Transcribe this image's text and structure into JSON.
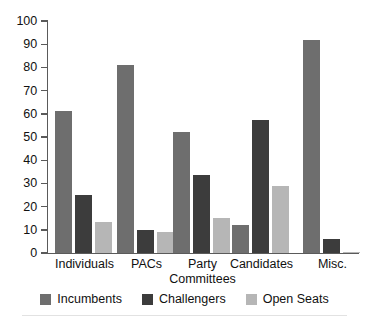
{
  "chart_data": {
    "type": "bar",
    "title": "",
    "subtitle": "",
    "xlabel": "",
    "ylabel": "",
    "ylim": [
      0,
      100
    ],
    "ytick_step": 10,
    "yticks": [
      100,
      90,
      80,
      70,
      60,
      50,
      40,
      30,
      20,
      10,
      0
    ],
    "grid": false,
    "legend_position": "bottom-center",
    "categories": [
      "Individuals",
      "PACs",
      "Party\nCommittees",
      "Candidates",
      "Misc."
    ],
    "series": [
      {
        "name": "Incumbents",
        "color": "#6e6e6e",
        "values": [
          61,
          81,
          52,
          12,
          92
        ]
      },
      {
        "name": "Challengers",
        "color": "#3c3c3c",
        "values": [
          25,
          10,
          33.5,
          57.5,
          6
        ]
      },
      {
        "name": "Open Seats",
        "color": "#b6b6b6",
        "values": [
          13.5,
          9,
          15,
          29,
          0.5
        ]
      }
    ]
  },
  "axis": {
    "tick_labels": [
      "100",
      "90",
      "80",
      "70",
      "60",
      "50",
      "40",
      "30",
      "20",
      "10",
      "0"
    ]
  },
  "category_labels": [
    "Individuals",
    "PACs",
    "Party\nCommittees",
    "Candidates",
    "Misc."
  ],
  "legend": {
    "items": [
      {
        "label": "Incumbents",
        "color": "#6e6e6e"
      },
      {
        "label": "Challengers",
        "color": "#3c3c3c"
      },
      {
        "label": "Open Seats",
        "color": "#b6b6b6"
      }
    ]
  }
}
